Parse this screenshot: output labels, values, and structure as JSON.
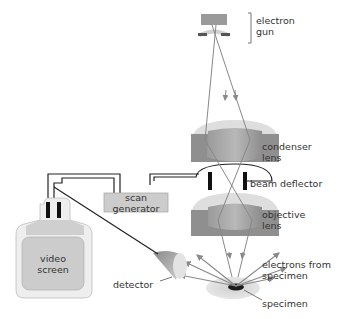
{
  "diagram": {
    "labels": {
      "electron_gun": [
        "electron",
        "gun"
      ],
      "condenser_lens": [
        "condenser",
        "lens"
      ],
      "beam_deflector": "beam deflector",
      "objective_lens": [
        "objective",
        "lens"
      ],
      "electrons_from_specimen": [
        "electrons from",
        "specimen"
      ],
      "specimen": "specimen",
      "detector": "detector",
      "scan_generator": [
        "scan",
        "generator"
      ],
      "video_screen": [
        "video",
        "screen"
      ]
    },
    "colors": {
      "lens_dark": "#8f8f8f",
      "lens_light": "#d9d9d9",
      "beam": "#888888",
      "arrow": "#8a8a8a",
      "box_fill": "#cccccc",
      "wire": "#222222",
      "specimen": "#1a1a1a"
    }
  }
}
